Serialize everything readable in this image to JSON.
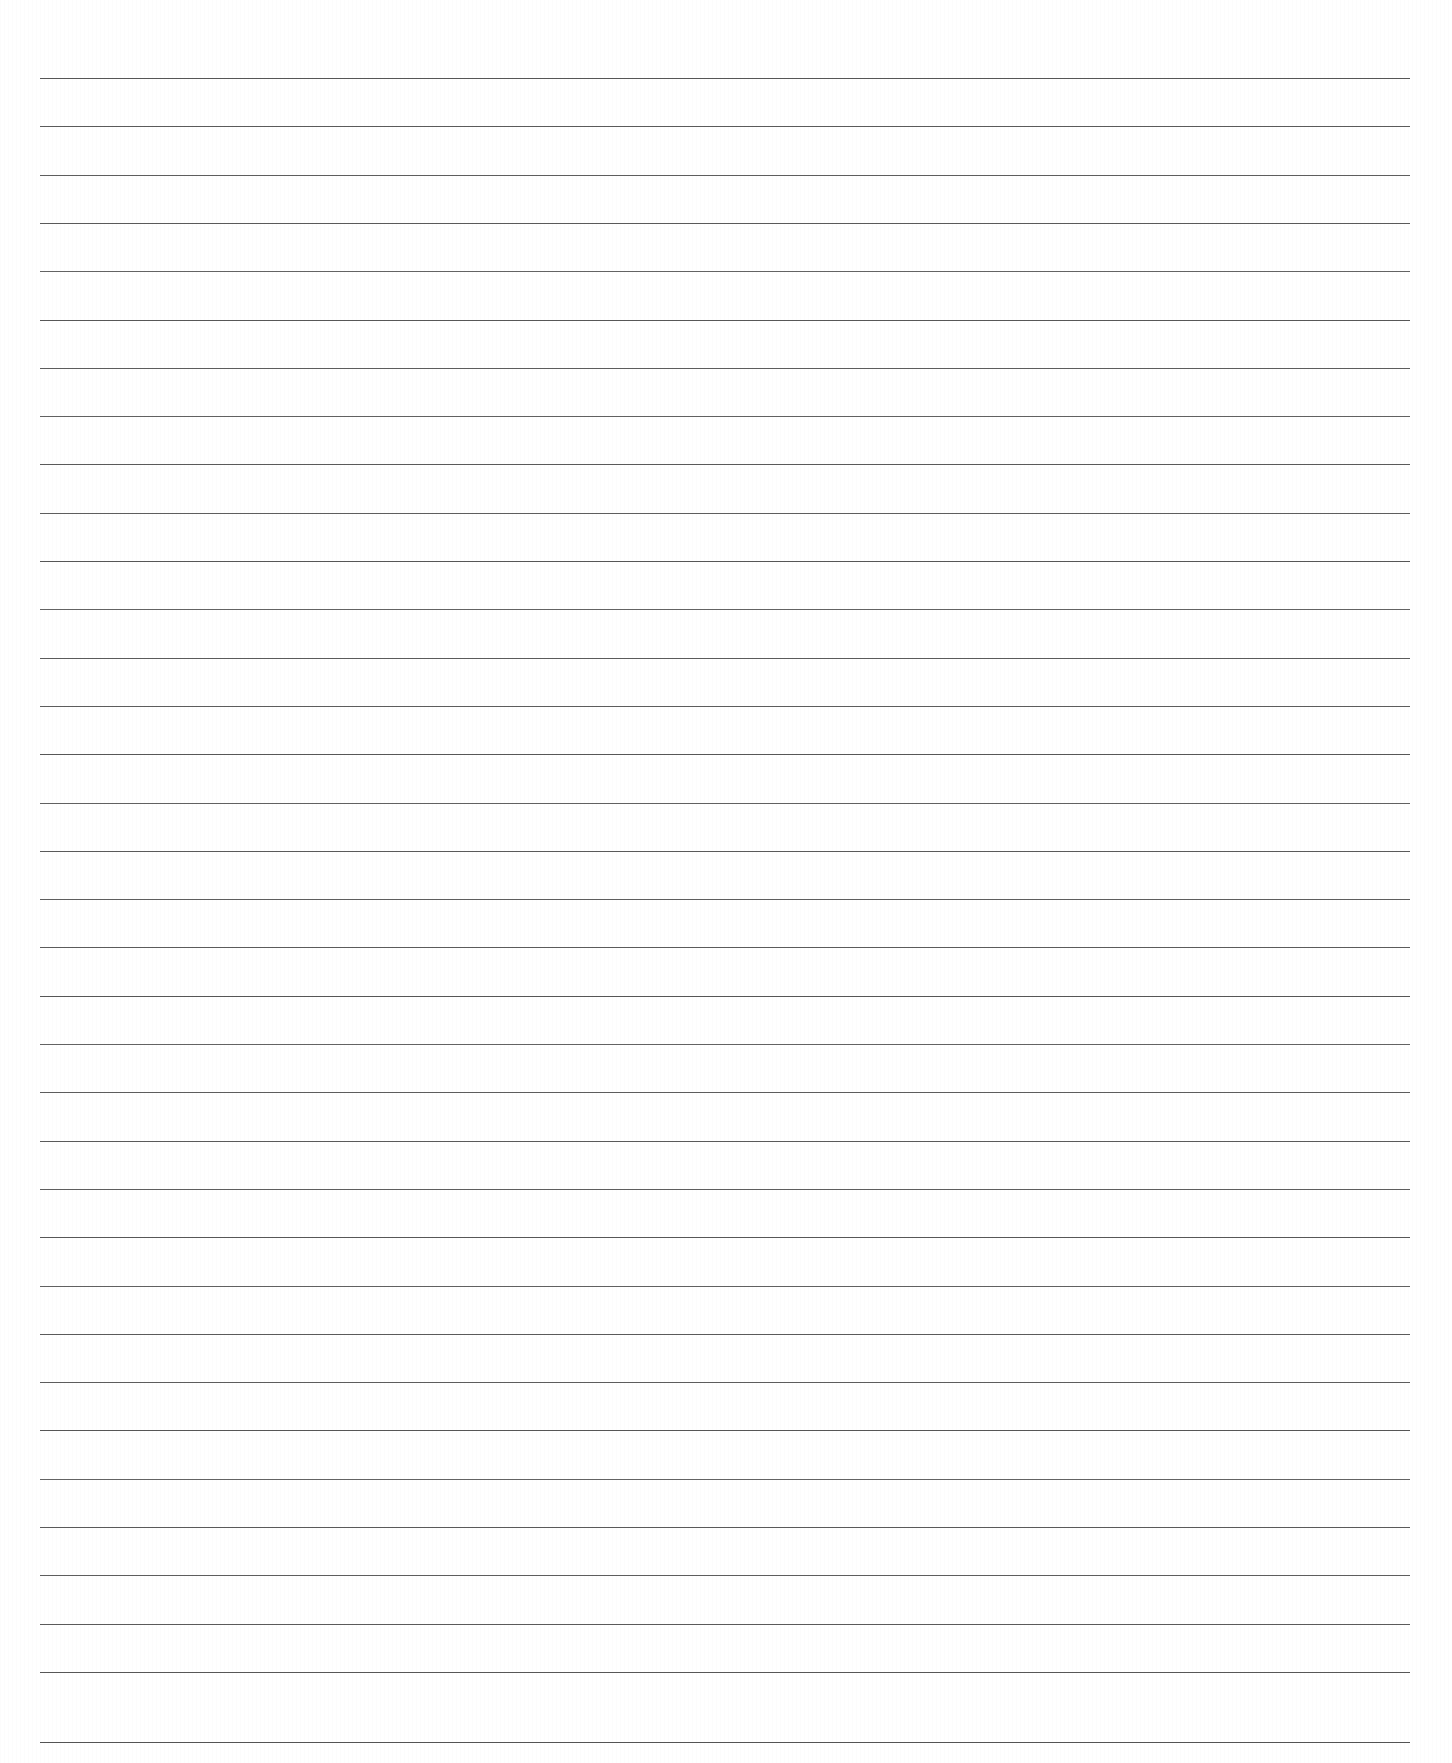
{
  "document": {
    "kind": "ruled-notebook-paper-scan",
    "title": "Blank Lined Paper",
    "page_width": 1452,
    "page_height": 1763,
    "background_color": "#ffffff",
    "body_text": "",
    "handwriting_present": "none",
    "printed_text_present": "none"
  },
  "ruling": {
    "line_color": "#4d4d4d",
    "line_thickness_px": 1.3,
    "line_count": 35,
    "line_start_x": 40,
    "line_end_x": 1410,
    "line_length_px": 1370,
    "first_line_y": 78,
    "last_line_y": 1742,
    "line_spacing_px": 48.3,
    "orientation": "horizontal",
    "margin_rule_present": "none",
    "top_margin_px": 78,
    "bottom_margin_px": 21,
    "left_margin_px": 40,
    "right_margin_px": 42,
    "lines_y": [
      78,
      126.3,
      174.6,
      222.9,
      271.2,
      319.5,
      367.8,
      416.1,
      464.4,
      512.7,
      561,
      609.3,
      657.6,
      705.9,
      754.2,
      802.5,
      850.8,
      899.1,
      947.4,
      995.7,
      1044,
      1092.3,
      1140.6,
      1188.9,
      1237.2,
      1285.5,
      1333.8,
      1382.1,
      1430.4,
      1478.7,
      1527,
      1575.3,
      1623.6,
      1671.9,
      1742
    ],
    "line_opacities": [
      0.95,
      0.92,
      0.9,
      0.93,
      0.88,
      0.94,
      0.91,
      0.89,
      0.93,
      0.9,
      0.95,
      0.88,
      0.92,
      0.91,
      0.94,
      0.89,
      0.93,
      0.9,
      0.92,
      0.95,
      0.88,
      0.91,
      0.93,
      0.9,
      0.94,
      0.89,
      0.92,
      0.91,
      0.95,
      0.88,
      0.93,
      0.9,
      0.92,
      0.94,
      0.96
    ]
  }
}
